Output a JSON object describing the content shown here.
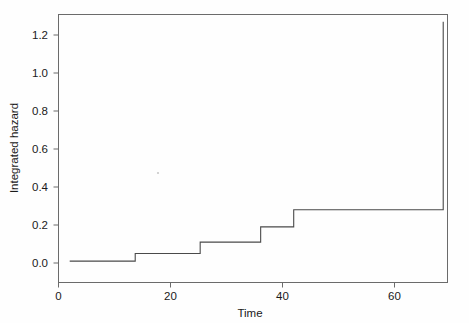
{
  "chart_data": {
    "type": "line",
    "subtype": "step-function",
    "title": "",
    "subtitle": "",
    "xlabel": "Time",
    "ylabel": "Integrated hazard",
    "xlim": [
      0.5,
      72
    ],
    "ylim": [
      -0.04,
      1.33
    ],
    "xticks": [
      0,
      20,
      40,
      60
    ],
    "xtick_labels": [
      "0",
      "20",
      "40",
      "60"
    ],
    "yticks": [
      0.0,
      0.2,
      0.4,
      0.6,
      0.8,
      1.0,
      1.2
    ],
    "ytick_labels": [
      "0.0",
      "0.2",
      "0.4",
      "0.6",
      "0.8",
      "1.0",
      "1.2"
    ],
    "grid": false,
    "legend": false,
    "legend_position": "none",
    "line_color": "#4a4a4a",
    "frame_color": "#6b6b6b",
    "background_color": "#ffffff",
    "series": [
      {
        "name": "Integrated hazard",
        "step_times": [
          2.0,
          13.7,
          25.3,
          36.1,
          42.0,
          68.7,
          69.5
        ],
        "step_values": [
          0.01,
          0.05,
          0.11,
          0.19,
          0.28,
          0.28,
          1.27
        ],
        "points": [
          {
            "x": 2.0,
            "y": 0.01
          },
          {
            "x": 13.7,
            "y": 0.01
          },
          {
            "x": 13.7,
            "y": 0.05
          },
          {
            "x": 25.3,
            "y": 0.05
          },
          {
            "x": 25.3,
            "y": 0.11
          },
          {
            "x": 36.1,
            "y": 0.11
          },
          {
            "x": 36.1,
            "y": 0.19
          },
          {
            "x": 42.0,
            "y": 0.19
          },
          {
            "x": 42.0,
            "y": 0.28
          },
          {
            "x": 68.7,
            "y": 0.28
          },
          {
            "x": 68.7,
            "y": 1.27
          }
        ]
      }
    ],
    "annotations": []
  }
}
